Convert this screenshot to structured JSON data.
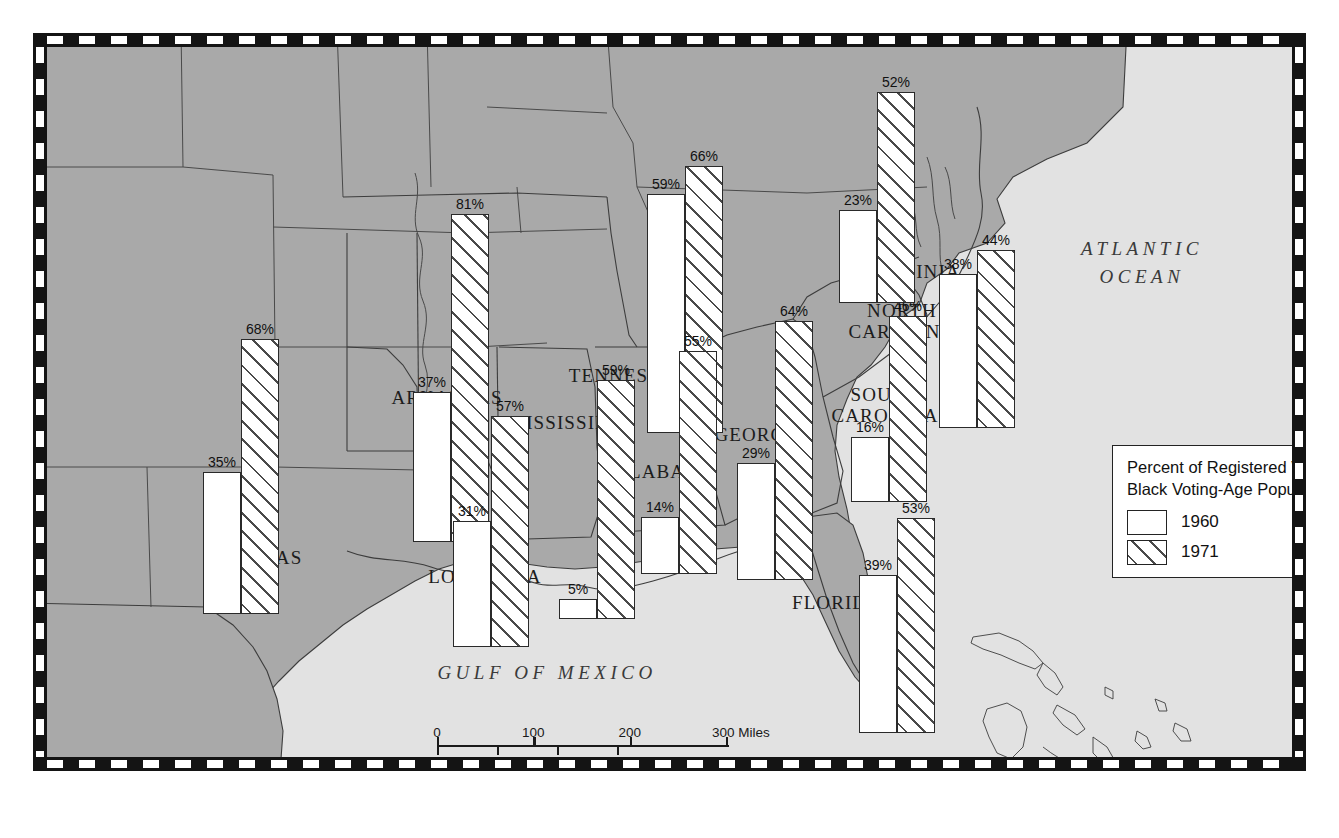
{
  "figure": {
    "water_label_atlantic_line1": "ATLANTIC",
    "water_label_atlantic_line2": "OCEAN",
    "water_label_gulf": "GULF OF MEXICO"
  },
  "legend": {
    "title_line1": "Percent of Registered Voters in",
    "title_line2": "Black Voting-Age Population",
    "entries": [
      {
        "label": "1960",
        "pattern": "solid-white"
      },
      {
        "label": "1971",
        "pattern": "diagonal-hatch"
      }
    ]
  },
  "scale": {
    "miles_ticks": [
      "0",
      "100",
      "200",
      "300 Miles"
    ],
    "km_ticks": [
      "0",
      "100",
      "200",
      "300 Kilometers"
    ]
  },
  "chart_data": {
    "type": "bar",
    "title": "Percent of Registered Voters in Black Voting-Age Population",
    "xlabel": "State",
    "ylabel": "Percent registered",
    "ylim": [
      0,
      100
    ],
    "categories": [
      "Texas",
      "Arkansas",
      "Louisiana",
      "Mississippi",
      "Tennessee",
      "Alabama",
      "Georgia",
      "Florida",
      "South Carolina",
      "North Carolina",
      "Virginia"
    ],
    "series": [
      {
        "name": "1960",
        "values": [
          35,
          37,
          31,
          5,
          59,
          14,
          29,
          39,
          16,
          38,
          23
        ]
      },
      {
        "name": "1971",
        "values": [
          68,
          81,
          57,
          59,
          66,
          55,
          64,
          53,
          46,
          44,
          52
        ]
      }
    ],
    "grid": false,
    "legend_position": "bottom-right"
  },
  "states": [
    {
      "name": "TEXAS",
      "label_x": 222,
      "label_y": 500,
      "label_lines": [
        "TEXAS"
      ],
      "group_x": 156,
      "group_y": 206,
      "base_y": 567,
      "v1960": 35,
      "v1971": 68,
      "t1960": "35%",
      "t1971": "68%"
    },
    {
      "name": "ARKANSAS",
      "label_x": 400,
      "label_y": 340,
      "label_lines": [
        "ARKANSAS"
      ],
      "group_x": 366,
      "group_y": 128,
      "base_y": 495,
      "v1960": 37,
      "v1971": 81,
      "t1960": "37%",
      "t1971": "81%"
    },
    {
      "name": "LOUISIANA",
      "label_x": 438,
      "label_y": 519,
      "label_lines": [
        "LOUISIANA"
      ],
      "group_x": 406,
      "group_y": 406,
      "base_y": 600,
      "v1960": 31,
      "v1971": 57,
      "t1960": "31%",
      "t1971": "57%"
    },
    {
      "name": "MISSISSIPPI",
      "label_x": 520,
      "label_y": 365,
      "label_lines": [
        "MISSISSIPPI"
      ],
      "group_x": 512,
      "group_y": 314,
      "base_y": 572,
      "v1960": 5,
      "v1971": 59,
      "t1960": "5%",
      "t1971": "59%"
    },
    {
      "name": "TENNESSEE",
      "label_x": 580,
      "label_y": 318,
      "label_lines": [
        "TENNESSEE"
      ],
      "group_x": 600,
      "group_y": 142,
      "base_y": 386,
      "v1960": 59,
      "v1971": 66,
      "t1960": "59%",
      "t1971": "66%"
    },
    {
      "name": "ALABAMA",
      "label_x": 619,
      "label_y": 414,
      "label_lines": [
        "ALABAMA"
      ],
      "group_x": 594,
      "group_y": 310,
      "base_y": 527,
      "v1960": 14,
      "v1971": 55,
      "t1960": "14%",
      "t1971": "55%"
    },
    {
      "name": "GEORGIA",
      "label_x": 714,
      "label_y": 377,
      "label_lines": [
        "GEORGIA"
      ],
      "group_x": 690,
      "group_y": 309,
      "base_y": 533,
      "v1960": 29,
      "v1971": 64,
      "t1960": "29%",
      "t1971": "64%"
    },
    {
      "name": "FLORIDA",
      "label_x": 790,
      "label_y": 545,
      "label_lines": [
        "FLORIDA"
      ],
      "group_x": 812,
      "group_y": 527,
      "base_y": 686,
      "v1960": 39,
      "v1971": 53,
      "t1960": "39%",
      "t1971": "53%"
    },
    {
      "name": "SOUTH CAROLINA",
      "label_x": 838,
      "label_y": 337,
      "label_lines": [
        "SOUTH",
        "CAROLINA"
      ],
      "group_x": 804,
      "group_y": 297,
      "base_y": 455,
      "v1960": 16,
      "v1971": 46,
      "t1960": "16%",
      "t1971": "46%"
    },
    {
      "name": "NORTH CAROLINA",
      "label_x": 855,
      "label_y": 253,
      "label_lines": [
        "NORTH",
        "CAROLINA"
      ],
      "group_x": 892,
      "group_y": 229,
      "base_y": 381,
      "v1960": 38,
      "v1971": 44,
      "t1960": "38%",
      "t1971": "44%"
    },
    {
      "name": "VIRGINIA",
      "label_x": 866,
      "label_y": 214,
      "label_lines": [
        "VIRGINIA"
      ],
      "group_x": 792,
      "group_y": 86,
      "base_y": 256,
      "v1960": 23,
      "v1971": 52,
      "t1960": "23%",
      "t1971": "52%"
    }
  ]
}
